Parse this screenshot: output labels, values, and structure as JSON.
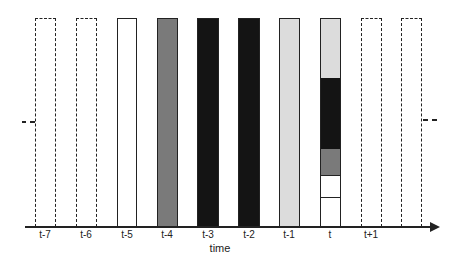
{
  "diagram": {
    "axis_title": "time",
    "colors": {
      "white": "#ffffff",
      "gray": "#7a7a7a",
      "black": "#141414",
      "light_gray": "#dcdcdc",
      "outline": "#222222"
    },
    "bars": [
      {
        "label": "t-7",
        "style": "dashed",
        "fill": "none"
      },
      {
        "label": "t-6",
        "style": "dashed",
        "fill": "none"
      },
      {
        "label": "t-5",
        "style": "solid",
        "fill": "white"
      },
      {
        "label": "t-4",
        "style": "solid",
        "fill": "gray"
      },
      {
        "label": "t-3",
        "style": "solid",
        "fill": "black"
      },
      {
        "label": "t-2",
        "style": "solid",
        "fill": "black"
      },
      {
        "label": "t-1",
        "style": "solid",
        "fill": "light_gray"
      },
      {
        "label": "t",
        "style": "solid",
        "fill": "stacked",
        "segments_top_to_bottom": [
          "light_gray",
          "black",
          "gray",
          "white",
          "white"
        ]
      },
      {
        "label": "t+1",
        "style": "dashed",
        "fill": "none"
      },
      {
        "label": "",
        "style": "dashed",
        "fill": "none"
      }
    ]
  }
}
